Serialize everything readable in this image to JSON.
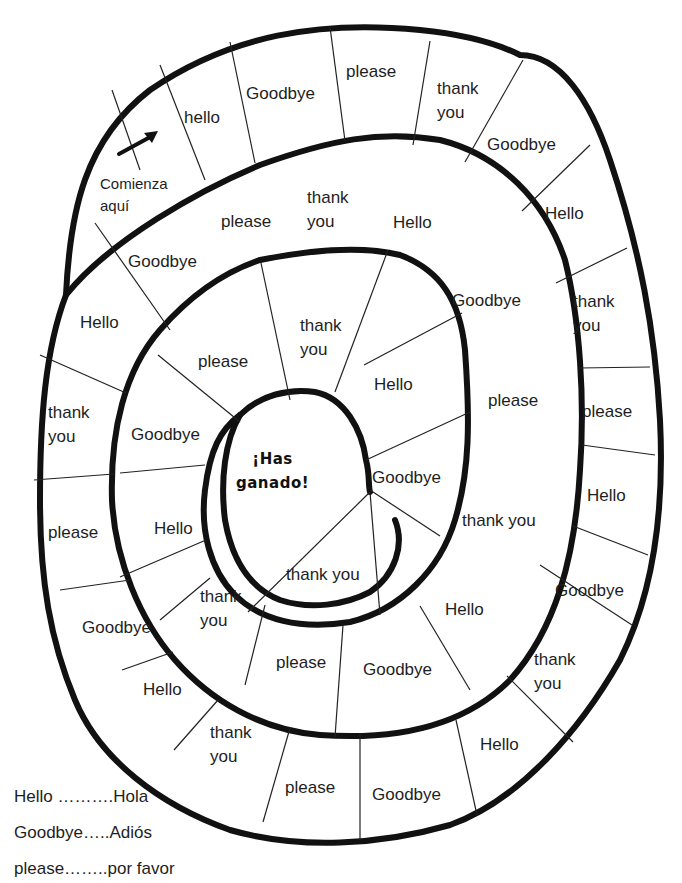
{
  "board": {
    "start_label": "Comienza aquí",
    "start_label_lines": [
      "Comienza",
      "aquí"
    ],
    "finish_label_lines": [
      "¡Has",
      "ganado!"
    ],
    "outer_ring": [
      {
        "text": "hello"
      },
      {
        "text": "Goodbye"
      },
      {
        "text": "please"
      },
      {
        "text": "thank you",
        "lines": [
          "thank",
          "you"
        ]
      },
      {
        "text": "Goodbye"
      },
      {
        "text": "Hello"
      },
      {
        "text": "thank you",
        "lines": [
          "thank",
          "you"
        ]
      },
      {
        "text": "please"
      },
      {
        "text": "Hello"
      },
      {
        "text": "Goodbye"
      },
      {
        "text": "thank you",
        "lines": [
          "thank",
          "you"
        ]
      },
      {
        "text": "Hello"
      },
      {
        "text": "Goodbye"
      },
      {
        "text": "please"
      },
      {
        "text": "thank you",
        "lines": [
          "thank",
          "you"
        ]
      },
      {
        "text": "Hello"
      },
      {
        "text": "Goodbye"
      },
      {
        "text": "please"
      },
      {
        "text": "thank you",
        "lines": [
          "thank",
          "you"
        ]
      },
      {
        "text": "Hello"
      },
      {
        "text": "Goodbye"
      }
    ],
    "middle_ring": [
      {
        "text": "please"
      },
      {
        "text": "thank you",
        "lines": [
          "thank",
          "you"
        ]
      },
      {
        "text": "Hello"
      },
      {
        "text": "Goodbye"
      },
      {
        "text": "please"
      },
      {
        "text": "thank you"
      },
      {
        "text": "Hello"
      },
      {
        "text": "thank you",
        "lines": [
          "thank",
          "you"
        ]
      },
      {
        "text": "Goodbye"
      },
      {
        "text": "please"
      },
      {
        "text": "thank you",
        "lines": [
          "thank",
          "you"
        ]
      },
      {
        "text": "Hello"
      },
      {
        "text": "Goodbye"
      },
      {
        "text": "please"
      }
    ],
    "inner_ring": [
      {
        "text": "thank you",
        "lines": [
          "thank",
          "you"
        ]
      },
      {
        "text": "Hello"
      },
      {
        "text": "Goodbye"
      },
      {
        "text": "thank you"
      }
    ]
  },
  "legend": [
    {
      "english": "Hello",
      "dots": " ……….",
      "spanish": "Hola",
      "full": "Hello ……….Hola"
    },
    {
      "english": "Goodbye",
      "dots": "…..",
      "spanish": "Adiós",
      "full": "Goodbye…..Adiós"
    },
    {
      "english": "please",
      "dots": "……..",
      "spanish": "por favor",
      "full": "please……..por favor"
    }
  ],
  "colors": {
    "ink": "#111111",
    "paper": "#ffffff"
  }
}
